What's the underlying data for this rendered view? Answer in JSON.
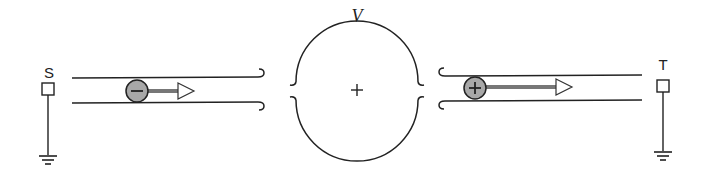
{
  "diagram": {
    "source_label": "S",
    "target_label": "T",
    "potential_label": "V",
    "center_sign": "+",
    "left_particle": {
      "sign": "−",
      "charge": "negative",
      "direction": "right"
    },
    "right_particle": {
      "sign": "+",
      "charge": "positive",
      "direction": "right"
    },
    "colors": {
      "stroke": "#222222",
      "particle_fill": "#a8a8a8",
      "arrow_shaft": "#777777"
    }
  }
}
